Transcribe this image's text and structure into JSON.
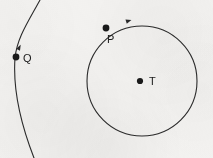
{
  "figure": {
    "name": "circle-and-arc-geometry-diagram",
    "width": 213,
    "height": 158,
    "background_color": "#f4f3f1",
    "ink_color": "#2b2b2b",
    "stroke_width": 1.1
  },
  "circle": {
    "name": "main-circle",
    "center_x": 142,
    "center_y": 81,
    "radius": 55,
    "center_point": {
      "label": "T",
      "x": 140,
      "y": 81,
      "dot_radius": 3.1,
      "label_x": 149,
      "label_y": 85
    },
    "point_on_circle": {
      "label": "P",
      "x": 106,
      "y": 28,
      "dot_radius": 3.4,
      "label_x": 107,
      "label_y": 43
    },
    "direction_marker": {
      "name": "arrowhead-on-circle",
      "x": 128,
      "y": 21,
      "angle_deg": -18
    }
  },
  "arc": {
    "name": "left-arc",
    "path": "M 40 0 C 28 22 17 38 15 58 C 13 86 20 122 34 158",
    "point_on_arc": {
      "label": "Q",
      "x": 16,
      "y": 57,
      "dot_radius": 3.4,
      "label_x": 23,
      "label_y": 62
    },
    "direction_marker": {
      "name": "arrowhead-on-arc",
      "x": 19,
      "y": 48,
      "angle_deg": -62
    }
  },
  "labels": {
    "p": "P",
    "q": "Q",
    "t": "T"
  }
}
